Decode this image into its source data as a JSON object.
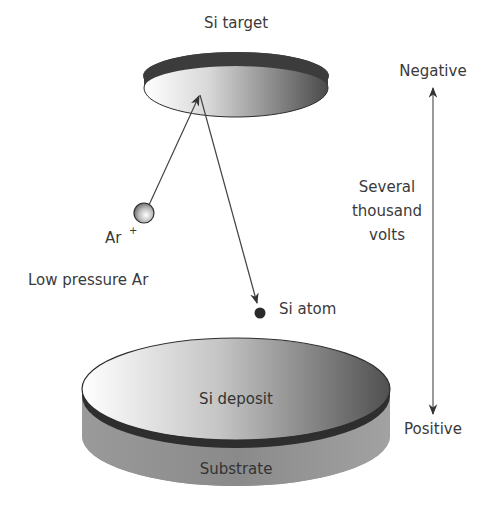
{
  "labels": {
    "si_target": "Si target",
    "ar_ion": "Ar",
    "ar_ion_charge": "+",
    "low_pressure": "Low pressure Ar",
    "si_atom": "Si atom",
    "si_deposit": "Si deposit",
    "substrate": "Substrate",
    "negative": "Negative",
    "positive": "Positive",
    "voltage_line1": "Several",
    "voltage_line2": "thousand",
    "voltage_line3": "volts"
  },
  "colors": {
    "background": "#ffffff",
    "text": "#3a3a3a",
    "line": "#444444",
    "target_rim": "#3c3c3c",
    "substrate_side": "#8e8e8e",
    "deposit_band": "#2e2e2e",
    "atom": "#2a2a2a"
  }
}
